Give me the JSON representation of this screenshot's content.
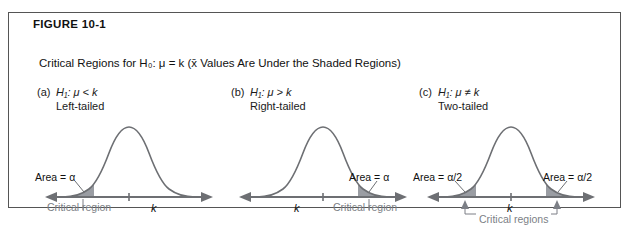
{
  "figure": {
    "tag": "FIGURE 10-1",
    "caption": "Critical Regions for H₀: μ = k (x̄ Values Are Under the Shaded Regions)"
  },
  "colors": {
    "border": "#555555",
    "curve": "#6d6f73",
    "shade": "#9a9da3",
    "axis": "#6d6f73",
    "critical_text": "#7c7f86",
    "text": "#111111"
  },
  "panels": [
    {
      "letter": "(a)",
      "hypothesis": "H₁:  μ < k",
      "tail": "Left-tailed",
      "area_label": "Area = α",
      "critical_label": "Critical region",
      "axis_tick": "k",
      "shaded_tails": [
        "left"
      ]
    },
    {
      "letter": "(b)",
      "hypothesis": "H₁:  μ > k",
      "tail": "Right-tailed",
      "area_label": "Area = α",
      "critical_label": "Critical region",
      "axis_tick": "k",
      "shaded_tails": [
        "right"
      ]
    },
    {
      "letter": "(c)",
      "hypothesis": "H₁:  μ ≠ k",
      "tail": "Two-tailed",
      "area_label_left": "Area = α/2",
      "area_label_right": "Area = α/2",
      "critical_label": "Critical regions",
      "axis_tick": "k",
      "shaded_tails": [
        "left",
        "right"
      ]
    }
  ]
}
